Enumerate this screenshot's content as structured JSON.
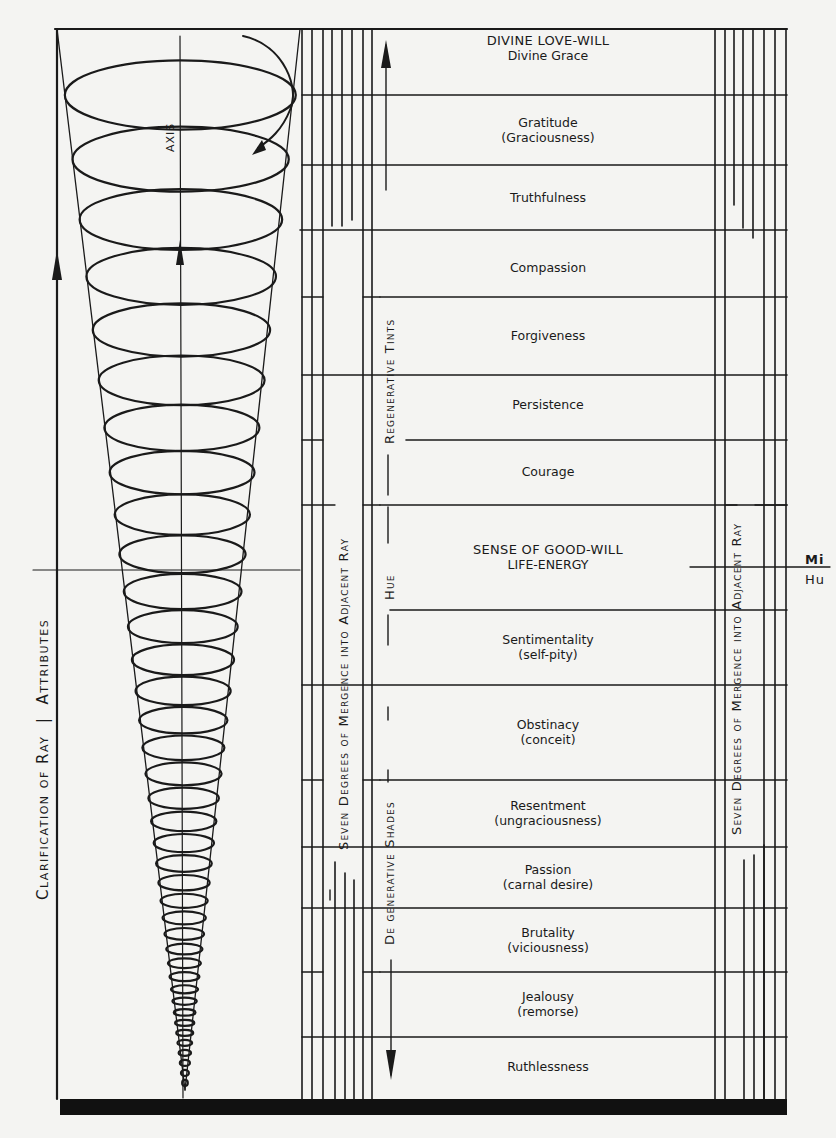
{
  "diagram": {
    "left_axis_label": {
      "part1": "Clarification of Ray",
      "divider": "|",
      "part2": "Attributes"
    },
    "spiral_axis_label": "AXIS",
    "merge_label_left": "Seven Degrees of Mergence into Adjacent Ray",
    "merge_label_right": "Seven Degrees of Mergence into Adjacent Ray",
    "regenerative_label": "Regenerative Tints",
    "hue_label": "Hue",
    "degenerative_label": "De generative Shades",
    "edge_text_top": "Mi",
    "edge_text_bottom": "Hu",
    "rows": [
      {
        "primary": "DIVINE LOVE-WILL",
        "secondary": "Divine Grace",
        "caps": true
      },
      {
        "primary": "Gratitude",
        "secondary": "(Graciousness)"
      },
      {
        "primary": "Truthfulness",
        "secondary": ""
      },
      {
        "primary": "Compassion",
        "secondary": ""
      },
      {
        "primary": "Forgiveness",
        "secondary": ""
      },
      {
        "primary": "Persistence",
        "secondary": ""
      },
      {
        "primary": "Courage",
        "secondary": ""
      },
      {
        "primary": "SENSE OF GOOD-WILL",
        "secondary": "LIFE-ENERGY",
        "caps": true
      },
      {
        "primary": "Sentimentality",
        "secondary": "(self-pity)"
      },
      {
        "primary": "Obstinacy",
        "secondary": "(conceit)"
      },
      {
        "primary": "Resentment",
        "secondary": "(ungraciousness)"
      },
      {
        "primary": "Passion",
        "secondary": "(carnal desire)"
      },
      {
        "primary": "Brutality",
        "secondary": "(viciousness)"
      },
      {
        "primary": "Jealousy",
        "secondary": "(remorse)"
      },
      {
        "primary": "Ruthlessness",
        "secondary": ""
      }
    ],
    "colors": {
      "ink": "#1a1a1a",
      "paper": "#f4f4f2"
    }
  }
}
